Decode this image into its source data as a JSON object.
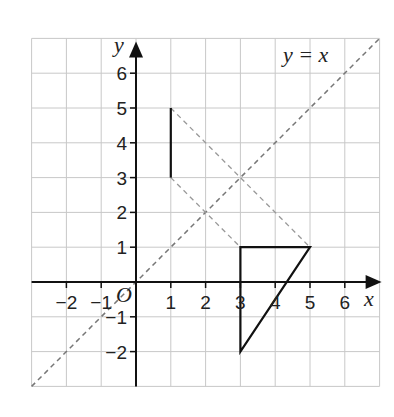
{
  "diagram": {
    "type": "coordinate-grid",
    "x_range": [
      -3,
      7
    ],
    "y_range": [
      -3,
      7
    ],
    "x_axis_label": "x",
    "y_axis_label": "y",
    "origin_label": "O",
    "x_ticks": [
      {
        "value": -2,
        "label": "−2"
      },
      {
        "value": -1,
        "label": "−1"
      },
      {
        "value": 1,
        "label": "1"
      },
      {
        "value": 2,
        "label": "2"
      },
      {
        "value": 3,
        "label": "3"
      },
      {
        "value": 4,
        "label": "4"
      },
      {
        "value": 5,
        "label": "5"
      },
      {
        "value": 6,
        "label": "6"
      }
    ],
    "y_ticks": [
      {
        "value": -2,
        "label": "−2"
      },
      {
        "value": -1,
        "label": "−1"
      },
      {
        "value": 1,
        "label": "1"
      },
      {
        "value": 2,
        "label": "2"
      },
      {
        "value": 3,
        "label": "3"
      },
      {
        "value": 4,
        "label": "4"
      },
      {
        "value": 5,
        "label": "5"
      },
      {
        "value": 6,
        "label": "6"
      }
    ],
    "mirror_line": {
      "label": "y = x",
      "from": [
        -3,
        -3
      ],
      "to": [
        7,
        7
      ],
      "style": "dashed"
    },
    "object_segment": {
      "from": [
        1,
        5
      ],
      "to": [
        1,
        3
      ],
      "style": "solid"
    },
    "construction_lines": [
      {
        "from": [
          1,
          5
        ],
        "to": [
          5,
          1
        ],
        "style": "dashed"
      },
      {
        "from": [
          1,
          3
        ],
        "to": [
          3,
          1
        ],
        "style": "dashed"
      }
    ],
    "image_segment": {
      "from": [
        3,
        1
      ],
      "to": [
        5,
        1
      ],
      "style": "solid"
    },
    "triangle": {
      "vertices": [
        [
          3,
          1
        ],
        [
          5,
          1
        ],
        [
          3,
          -2
        ]
      ],
      "style": "solid"
    },
    "colors": {
      "grid": "#c8c8c8",
      "axis": "#111111",
      "shape": "#111111",
      "dashed": "#777777"
    }
  }
}
